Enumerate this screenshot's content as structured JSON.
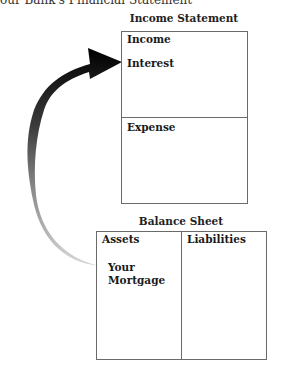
{
  "caption": "our Bank's Financial Statement",
  "income_statement": {
    "title": "Income Statement",
    "sections": [
      {
        "label": "Income",
        "items": [
          "Interest"
        ]
      },
      {
        "label": "Expense",
        "items": []
      }
    ]
  },
  "balance_sheet": {
    "title": "Balance Sheet",
    "columns": [
      {
        "label": "Assets",
        "items": [
          "Your",
          "Mortgage"
        ]
      },
      {
        "label": "Liabilities",
        "items": []
      }
    ]
  },
  "arrow": {
    "from": "Your Mortgage",
    "to": "Interest",
    "gradient_start": "#d0d0d0",
    "gradient_end": "#000000"
  }
}
